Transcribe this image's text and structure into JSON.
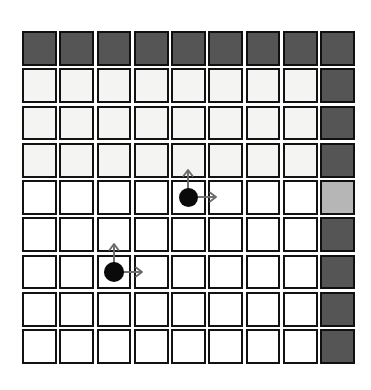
{
  "figure": {
    "name": "gridworld-diagram",
    "kind": "grid-world",
    "rows": 9,
    "cols": 9,
    "background_color": "#ffffff"
  },
  "legend": {
    "wall_color": "#555555",
    "goal_color": "#b6b6b6",
    "free_color": "#ffffff",
    "tinted_color": "#f4f4f2",
    "agent_color": "#0a0a0a",
    "arrow_color": "#6b6b6b",
    "cell_border_color": "#121212"
  },
  "grid": {
    "cells": [
      [
        "wall",
        "wall",
        "wall",
        "wall",
        "wall",
        "wall",
        "wall",
        "wall",
        "wall"
      ],
      [
        "tinted",
        "tinted",
        "tinted",
        "tinted",
        "tinted",
        "tinted",
        "tinted",
        "tinted",
        "wall"
      ],
      [
        "tinted",
        "tinted",
        "tinted",
        "tinted",
        "tinted",
        "tinted",
        "tinted",
        "tinted",
        "wall"
      ],
      [
        "tinted",
        "tinted",
        "tinted",
        "tinted",
        "tinted",
        "tinted",
        "tinted",
        "tinted",
        "wall"
      ],
      [
        "plain",
        "plain",
        "plain",
        "plain",
        "plain",
        "plain",
        "plain",
        "plain",
        "goal"
      ],
      [
        "plain",
        "plain",
        "plain",
        "plain",
        "plain",
        "plain",
        "plain",
        "plain",
        "wall"
      ],
      [
        "plain",
        "plain",
        "plain",
        "plain",
        "plain",
        "plain",
        "plain",
        "plain",
        "wall"
      ],
      [
        "plain",
        "plain",
        "plain",
        "plain",
        "plain",
        "plain",
        "plain",
        "plain",
        "wall"
      ],
      [
        "plain",
        "plain",
        "plain",
        "plain",
        "plain",
        "plain",
        "plain",
        "plain",
        "wall"
      ]
    ]
  },
  "agents": [
    {
      "id": "agent-upper",
      "row": 4,
      "col": 4,
      "arrows": [
        "up",
        "right"
      ]
    },
    {
      "id": "agent-lower",
      "row": 6,
      "col": 2,
      "arrows": [
        "up",
        "right"
      ]
    }
  ]
}
